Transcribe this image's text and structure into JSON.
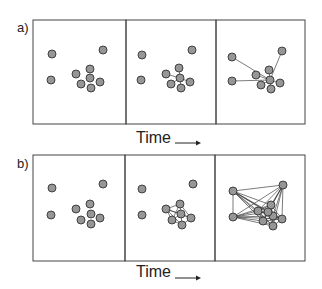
{
  "figure": {
    "rows": [
      {
        "label": "a)",
        "top": 20,
        "bottom": 124,
        "time_label": "Time",
        "time_y": 133,
        "panels": [
          {
            "x0": 33,
            "x1": 126,
            "dots": [
              [
                52,
                54
              ],
              [
                103,
                50
              ],
              [
                51,
                80
              ],
              [
                76,
                74
              ],
              [
                90,
                69
              ],
              [
                90,
                78
              ],
              [
                100,
                82
              ],
              [
                81,
                84
              ],
              [
                91,
                88
              ]
            ],
            "edges": []
          },
          {
            "x0": 126,
            "x1": 216,
            "dots": [
              [
                142,
                55
              ],
              [
                192,
                50
              ],
              [
                141,
                80
              ],
              [
                166,
                74
              ],
              [
                179,
                68
              ],
              [
                180,
                78
              ],
              [
                190,
                82
              ],
              [
                171,
                84
              ],
              [
                181,
                88
              ]
            ],
            "edges": [
              [
                5,
                3
              ],
              [
                5,
                4
              ],
              [
                5,
                6
              ],
              [
                5,
                7
              ],
              [
                5,
                8
              ]
            ]
          },
          {
            "x0": 216,
            "x1": 305,
            "dots": [
              [
                232,
                57
              ],
              [
                282,
                51
              ],
              [
                232,
                81
              ],
              [
                256,
                75
              ],
              [
                269,
                70
              ],
              [
                270,
                80
              ],
              [
                280,
                83
              ],
              [
                261,
                85
              ],
              [
                271,
                89
              ]
            ],
            "edges": [
              [
                5,
                0
              ],
              [
                5,
                1
              ],
              [
                5,
                2
              ],
              [
                5,
                3
              ],
              [
                5,
                4
              ],
              [
                5,
                6
              ],
              [
                5,
                7
              ],
              [
                5,
                8
              ]
            ]
          }
        ]
      },
      {
        "label": "b)",
        "top": 155,
        "bottom": 261,
        "time_label": "Time",
        "time_y": 268,
        "panels": [
          {
            "x0": 33,
            "x1": 125,
            "dots": [
              [
                52,
                188
              ],
              [
                103,
                184
              ],
              [
                51,
                215
              ],
              [
                76,
                209
              ],
              [
                90,
                204
              ],
              [
                91,
                214
              ],
              [
                100,
                218
              ],
              [
                81,
                220
              ],
              [
                91,
                224
              ]
            ],
            "edges": []
          },
          {
            "x0": 125,
            "x1": 215,
            "dots": [
              [
                142,
                189
              ],
              [
                193,
                184
              ],
              [
                142,
                215
              ],
              [
                166,
                209
              ],
              [
                180,
                204
              ],
              [
                181,
                214
              ],
              [
                191,
                218
              ],
              [
                172,
                220
              ],
              [
                182,
                225
              ]
            ],
            "edges": [
              [
                3,
                4
              ],
              [
                3,
                5
              ],
              [
                3,
                7
              ],
              [
                4,
                5
              ],
              [
                4,
                6
              ],
              [
                5,
                6
              ],
              [
                5,
                7
              ],
              [
                5,
                8
              ],
              [
                6,
                8
              ],
              [
                7,
                8
              ],
              [
                3,
                8
              ],
              [
                4,
                7
              ],
              [
                3,
                6
              ]
            ]
          },
          {
            "x0": 215,
            "x1": 305,
            "dots": [
              [
                233,
                191
              ],
              [
                283,
                185
              ],
              [
                233,
                217
              ],
              [
                258,
                211
              ],
              [
                271,
                205
              ],
              [
                273,
                216
              ],
              [
                282,
                219
              ],
              [
                263,
                221
              ],
              [
                273,
                226
              ],
              [
                268,
                212
              ]
            ],
            "edges": "all"
          }
        ]
      }
    ]
  },
  "colors": {
    "dot_fill": "#8a8a8a",
    "dot_stroke": "#333333",
    "line": "#444444",
    "frame": "#444444"
  }
}
